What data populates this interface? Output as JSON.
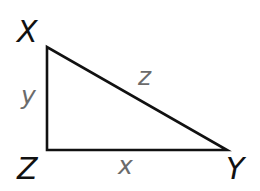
{
  "diagram": {
    "type": "right-triangle",
    "line_color": "#111111",
    "vertex_label_color": "#111111",
    "side_label_color": "#6b6b6b",
    "vertices": {
      "X": {
        "label": "X",
        "x": 47,
        "y": 47
      },
      "Z": {
        "label": "Z",
        "x": 47,
        "y": 150
      },
      "Y": {
        "label": "Y",
        "x": 227,
        "y": 150
      }
    },
    "sides": {
      "XZ": {
        "label": "y",
        "from": "X",
        "to": "Z"
      },
      "XY": {
        "label": "z",
        "from": "X",
        "to": "Y"
      },
      "ZY": {
        "label": "x",
        "from": "Z",
        "to": "Y"
      }
    },
    "right_angle_at": "Z"
  }
}
